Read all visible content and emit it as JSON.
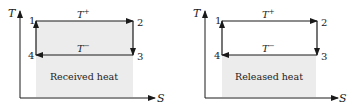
{
  "diagrams": [
    {
      "id": "left",
      "y_axis_label": "T",
      "x_axis_label": "S",
      "points": [
        "1",
        "2",
        "3",
        "4"
      ],
      "top_label": "T",
      "top_label_sup": "+",
      "bottom_label": "T",
      "bottom_label_sup": "−",
      "region_label": "Received heat",
      "shaded_region": "between top isotherm and S-axis"
    },
    {
      "id": "right",
      "y_axis_label": "T",
      "x_axis_label": "S",
      "points": [
        "1",
        "2",
        "3",
        "4"
      ],
      "top_label": "T",
      "top_label_sup": "+",
      "bottom_label": "T",
      "bottom_label_sup": "−",
      "region_label": "Released heat",
      "shaded_region": "between bottom isotherm and S-axis"
    }
  ],
  "colors": {
    "stroke": "#1a1a1a",
    "shade": "#ececec",
    "text": "#222222"
  }
}
